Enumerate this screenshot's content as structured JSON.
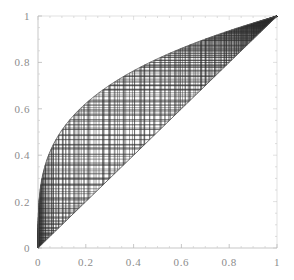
{
  "figure": {
    "title": "",
    "background": "#ffffff",
    "width": 294,
    "height": 280
  },
  "axes": {
    "frame_color": "#b9b9b9",
    "label_color": "#8c8c8c",
    "x_ticks": [
      "0",
      "0.2",
      "0.4",
      "0.6",
      "0.8",
      "1"
    ],
    "y_ticks": [
      "0",
      "0.2",
      "0.4",
      "0.6",
      "0.8",
      "1"
    ],
    "x_tick_values": [
      0,
      0.2,
      0.4,
      0.6,
      0.8,
      1
    ],
    "y_tick_values": [
      0,
      0.2,
      0.4,
      0.6,
      0.8,
      1
    ],
    "xlabel": "",
    "ylabel": ""
  },
  "chart_data": {
    "type": "line",
    "title": "",
    "xlabel": "",
    "ylabel": "",
    "xlim": [
      0,
      1
    ],
    "ylim": [
      0,
      1
    ],
    "grid": false,
    "legend": "none",
    "series": [
      {
        "name": "map-curve",
        "role": "function",
        "color": "#555555",
        "formula": "f(x) = x^(1/3.4)",
        "x": [
          0,
          0.02,
          0.05,
          0.08,
          0.12,
          0.16,
          0.2,
          0.25,
          0.3,
          0.35,
          0.4,
          0.45,
          0.5,
          0.55,
          0.6,
          0.65,
          0.7,
          0.75,
          0.8,
          0.85,
          0.9,
          0.95,
          1
        ],
        "values": [
          0,
          0.313,
          0.412,
          0.474,
          0.534,
          0.579,
          0.616,
          0.655,
          0.688,
          0.716,
          0.741,
          0.764,
          0.784,
          0.803,
          0.821,
          0.837,
          0.853,
          0.867,
          0.881,
          0.895,
          0.908,
          0.92,
          1
        ]
      },
      {
        "name": "identity-diagonal",
        "role": "reference",
        "color": "#555555",
        "formula": "y = x",
        "x": [
          0,
          1
        ],
        "values": [
          0,
          1
        ]
      },
      {
        "name": "cobweb-orbit",
        "role": "iteration",
        "color": "#2e2e2e",
        "start_x": 0.999,
        "iterations": 120,
        "direction": "backward",
        "note": "alternating vertical/horizontal segments between curve and diagonal"
      }
    ]
  },
  "marks": {
    "cobweb_line_color": "#2e2e2e",
    "curve_line_color": "#555555",
    "accumulation_points": [
      {
        "x": 0,
        "y": 0,
        "label": "origin-accumulation"
      },
      {
        "x": 1,
        "y": 1,
        "label": "fixed-point"
      },
      {
        "x": 0.745,
        "y": 0.765,
        "label": "inner-convergence-knot"
      }
    ]
  }
}
